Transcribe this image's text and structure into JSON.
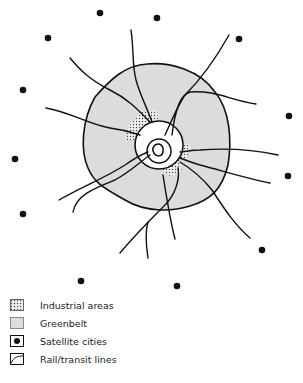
{
  "diagram": {
    "title": "",
    "center": {
      "x": 155,
      "y": 150
    },
    "colors": {
      "ink": "#111111",
      "greenbelt": "#d8d8d8",
      "industrial": "#b8b8b8"
    },
    "satellite_cities": [
      {
        "x": 100,
        "y": 13
      },
      {
        "x": 157,
        "y": 18
      },
      {
        "x": 48,
        "y": 38
      },
      {
        "x": 239,
        "y": 39
      },
      {
        "x": 23,
        "y": 90
      },
      {
        "x": 289,
        "y": 116
      },
      {
        "x": 15,
        "y": 159
      },
      {
        "x": 288,
        "y": 176
      },
      {
        "x": 23,
        "y": 214
      },
      {
        "x": 262,
        "y": 250
      },
      {
        "x": 81,
        "y": 281
      },
      {
        "x": 177,
        "y": 286
      }
    ]
  },
  "legend": {
    "items": [
      {
        "symbol": "industrial-swatch",
        "label": "Industrial areas"
      },
      {
        "symbol": "greenbelt-swatch",
        "label": "Greenbelt"
      },
      {
        "symbol": "satellite-city-swatch",
        "label": "Satellite cities"
      },
      {
        "symbol": "rail-line-swatch",
        "label": "Rail/transit lines"
      }
    ]
  }
}
